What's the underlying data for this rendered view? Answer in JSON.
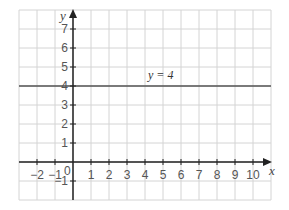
{
  "chart_data": {
    "type": "line",
    "title": "",
    "xlabel": "x",
    "ylabel": "y",
    "xlim": [
      -3,
      11
    ],
    "ylim": [
      -2,
      8
    ],
    "grid": true,
    "x_ticks": [
      "-2",
      "-1",
      "0",
      "1",
      "2",
      "3",
      "4",
      "5",
      "6",
      "7",
      "8",
      "9",
      "10"
    ],
    "y_ticks": [
      "-1",
      "1",
      "2",
      "3",
      "4",
      "5",
      "6",
      "7"
    ],
    "origin_label": "0",
    "series": [
      {
        "name": "y = 4",
        "x": [
          -3,
          11
        ],
        "y": [
          4,
          4
        ],
        "color": "#555555"
      }
    ],
    "annotations": [
      {
        "text": "y = 4",
        "x": 4.5,
        "y": 4.3
      }
    ]
  },
  "labels": {
    "x_axis": "x",
    "y_axis": "y",
    "origin": "0",
    "line": "y = 4"
  }
}
